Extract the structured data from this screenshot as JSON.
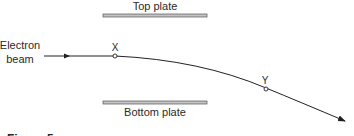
{
  "diagram": {
    "top_plate_label": "Top plate",
    "bottom_plate_label": "Bottom plate",
    "beam_label_line1": "Electron",
    "beam_label_line2": "beam",
    "point_x_label": "X",
    "point_y_label": "Y",
    "figure_caption": "Figure 5",
    "colors": {
      "plate_fill": "#b8b8b8",
      "plate_edge": "#555555",
      "line": "#222222",
      "text": "#2a2a2a"
    }
  }
}
